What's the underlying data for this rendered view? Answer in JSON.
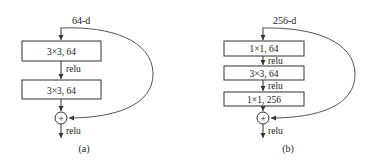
{
  "diagrams": [
    {
      "id": "a",
      "input_label": "64-d",
      "layers": [
        "3×3, 64",
        "3×3, 64"
      ],
      "activations": [
        "relu"
      ],
      "add_symbol": "+",
      "output_activation": "relu",
      "caption": "(a)"
    },
    {
      "id": "b",
      "input_label": "256-d",
      "layers": [
        "1×1, 64",
        "3×3, 64",
        "1×1, 256"
      ],
      "activations": [
        "relu",
        "relu"
      ],
      "add_symbol": "+",
      "output_activation": "relu",
      "caption": "(b)"
    }
  ],
  "colors": {
    "stroke": "#333333",
    "curve": "#555555",
    "text": "#222222",
    "background": "#ffffff"
  }
}
